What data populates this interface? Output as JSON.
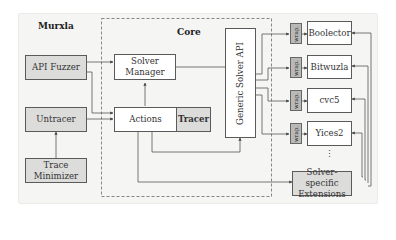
{
  "diagram": {
    "regions": {
      "murxla": "Murxla",
      "core": "Core"
    },
    "boxes": {
      "api_fuzzer": "API Fuzzer",
      "untracer": "Untracer",
      "trace_minimizer_1": "Trace",
      "trace_minimizer_2": "Minimizer",
      "solver_manager_1": "Solver",
      "solver_manager_2": "Manager",
      "actions": "Actions",
      "tracer": "Tracer",
      "generic_solver_api": "Generic Solver API",
      "solver_specific_1": "Solver-specific",
      "solver_specific_2": "Extensions"
    },
    "wrap_label": "wrap.",
    "solvers": [
      "Boolector",
      "Bitwuzla",
      "cvc5",
      "Yices2"
    ],
    "ellipsis": "⋮",
    "colors": {
      "panel_bg": "#f5f5f4",
      "box_gray": "#dcdcdb",
      "wrap_gray": "#b9b9b8",
      "line": "#555555"
    }
  }
}
